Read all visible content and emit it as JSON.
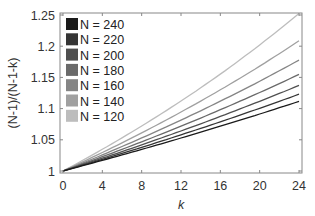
{
  "chart_data": {
    "type": "line",
    "title": "",
    "xlabel": "k",
    "ylabel": "(N-1)/(N-1-k)",
    "xlim": [
      0,
      24
    ],
    "ylim": [
      1,
      1.25
    ],
    "xticks": [
      0,
      4,
      8,
      12,
      16,
      20,
      24
    ],
    "xtick_labels": [
      "0",
      "4",
      "8",
      "12",
      "16",
      "20",
      "24"
    ],
    "yticks": [
      1,
      1.05,
      1.1,
      1.15,
      1.2,
      1.25
    ],
    "ytick_labels": [
      "1",
      "1.05",
      "1.1",
      "1.15",
      "1.2",
      "1.25"
    ],
    "grid": false,
    "legend_position": "upper left",
    "x": [
      0,
      4,
      8,
      12,
      16,
      20,
      24
    ],
    "series": [
      {
        "name": "N = 240",
        "color": "#1a1a1a",
        "values": [
          1.0,
          1.0171,
          1.0347,
          1.0529,
          1.0717,
          1.0912,
          1.1116
        ]
      },
      {
        "name": "N = 220",
        "color": "#353535",
        "values": [
          1.0,
          1.0186,
          1.038,
          1.0581,
          1.0789,
          1.1005,
          1.1231
        ]
      },
      {
        "name": "N = 200",
        "color": "#4f4f4f",
        "values": [
          1.0,
          1.0205,
          1.0419,
          1.0642,
          1.0874,
          1.1117,
          1.1371
        ]
      },
      {
        "name": "N = 180",
        "color": "#6a6a6a",
        "values": [
          1.0,
          1.0229,
          1.0468,
          1.0719,
          1.0982,
          1.1258,
          1.1548
        ]
      },
      {
        "name": "N = 160",
        "color": "#858585",
        "values": [
          1.0,
          1.0258,
          1.053,
          1.0816,
          1.1119,
          1.1439,
          1.1778
        ]
      },
      {
        "name": "N = 140",
        "color": "#a0a0a0",
        "values": [
          1.0,
          1.0296,
          1.0611,
          1.0946,
          1.1303,
          1.1685,
          1.2087
        ]
      },
      {
        "name": "N = 120",
        "color": "#bdbdbd",
        "values": [
          1.0,
          1.0348,
          1.0721,
          1.1121,
          1.1551,
          1.201,
          1.2526
        ]
      }
    ]
  }
}
